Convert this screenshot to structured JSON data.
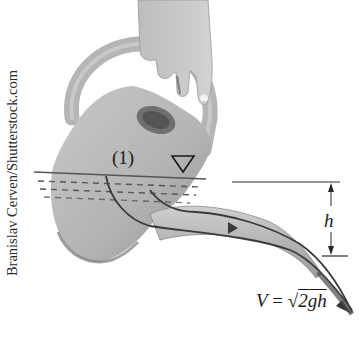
{
  "figure": {
    "credit": "Branislav Cerven/Shutterstock.com",
    "point_label": "(1)",
    "height_label": "h",
    "formula": {
      "lhs": "V",
      "equals": " = ",
      "radical": "√",
      "radicand": "2gh"
    },
    "colors": {
      "can": "#b9b9b9",
      "can_shadow": "#8e8e8e",
      "water_lines": "#555555",
      "annotation": "#2a2a2a",
      "stream": "#3a3a3a"
    }
  }
}
